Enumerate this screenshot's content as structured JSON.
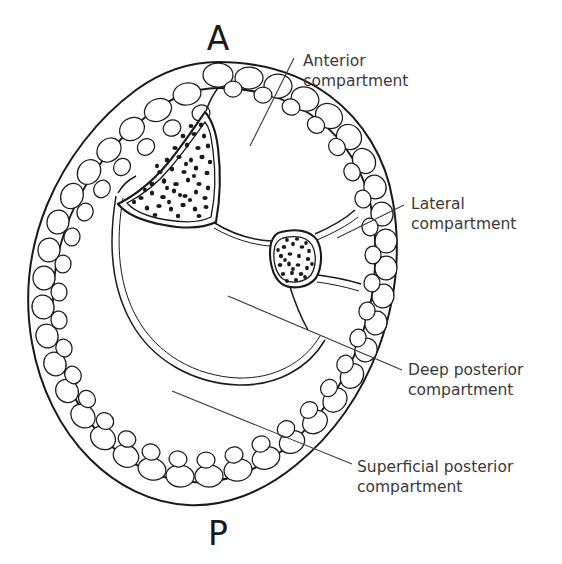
{
  "figure": {
    "background_color": "#ffffff",
    "ink_color": "#1a1a1a",
    "text_color": "#3a3a3a"
  },
  "orientation": {
    "anterior_marker": "A",
    "posterior_marker": "P"
  },
  "callouts": [
    {
      "id": "anterior",
      "line1": "Anterior",
      "line2": "compartment",
      "text_x": 303,
      "text_y": 66,
      "leader": {
        "x1": 250,
        "y1": 146,
        "x2": 294,
        "y2": 58
      }
    },
    {
      "id": "lateral",
      "line1": "Lateral",
      "line2": "compartment",
      "text_x": 411,
      "text_y": 209,
      "leader": {
        "x1": 337,
        "y1": 238,
        "x2": 404,
        "y2": 205
      }
    },
    {
      "id": "deep-posterior",
      "line1": "Deep posterior",
      "line2": "compartment",
      "text_x": 408,
      "text_y": 375,
      "leader": {
        "x1": 228,
        "y1": 296,
        "x2": 402,
        "y2": 370
      }
    },
    {
      "id": "superficial-posterior",
      "line1": "Superficial posterior",
      "line2": "compartment",
      "text_x": 357,
      "text_y": 472,
      "leader": {
        "x1": 172,
        "y1": 391,
        "x2": 352,
        "y2": 464
      }
    }
  ],
  "structures": {
    "subcutaneous_fat": "subcutaneous-fat-layer",
    "tibia": "tibia-bone",
    "fibula": "fibula-bone",
    "interosseous_membrane": "interosseous-membrane",
    "deep_fascia": "deep-transverse-fascia"
  }
}
